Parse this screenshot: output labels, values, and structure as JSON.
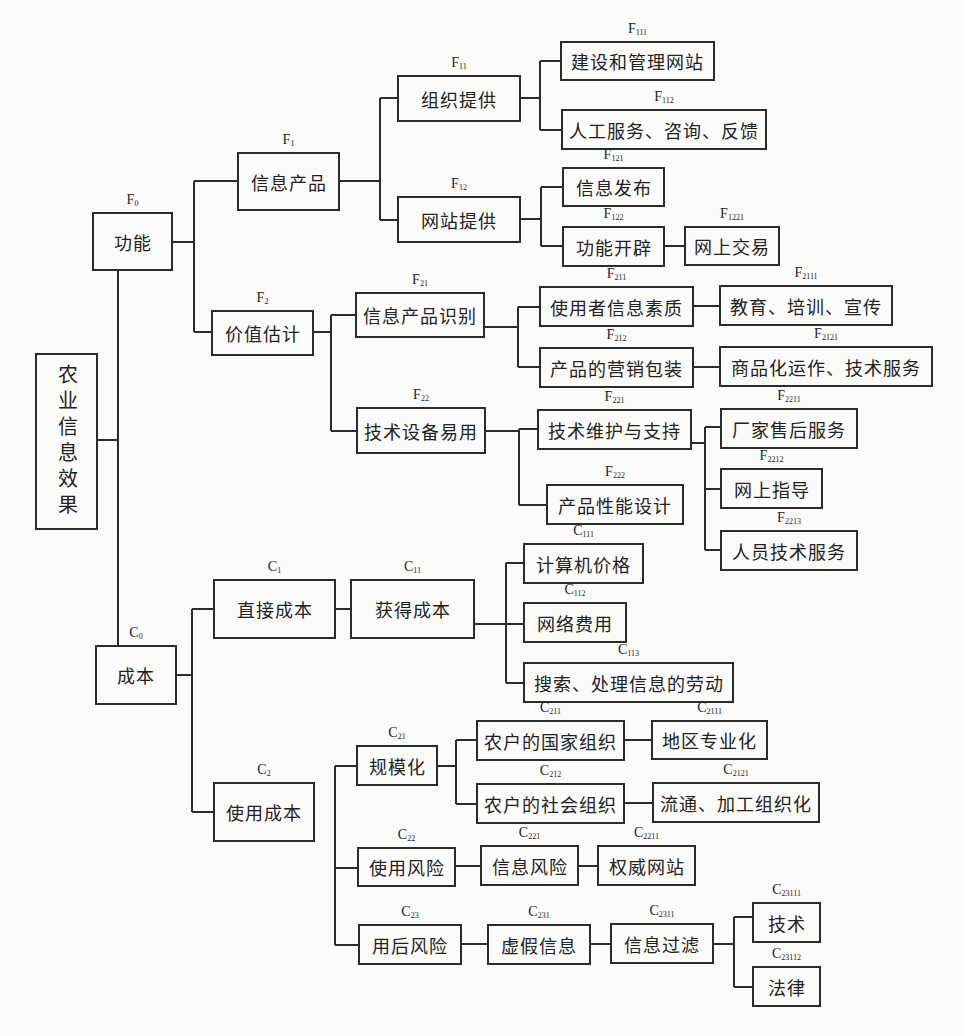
{
  "diagram": {
    "title": "农业信息效果",
    "root": {
      "id": "root",
      "label": "农业信息效果",
      "code": ""
    },
    "nodes": [
      {
        "id": "F0",
        "letter": "F",
        "sub": "0",
        "label": "功能",
        "x": 92,
        "y": 212,
        "w": 81,
        "h": 59
      },
      {
        "id": "F1",
        "letter": "F",
        "sub": "1",
        "label": "信息产品",
        "x": 237,
        "y": 152,
        "w": 103,
        "h": 59
      },
      {
        "id": "F11",
        "letter": "F",
        "sub": "11",
        "label": "组织提供",
        "x": 397,
        "y": 75,
        "w": 124,
        "h": 47
      },
      {
        "id": "F12",
        "letter": "F",
        "sub": "12",
        "label": "网站提供",
        "x": 397,
        "y": 196,
        "w": 124,
        "h": 47
      },
      {
        "id": "F111",
        "letter": "F",
        "sub": "111",
        "label": "建设和管理网站",
        "x": 560,
        "y": 41,
        "w": 155,
        "h": 40
      },
      {
        "id": "F112",
        "letter": "F",
        "sub": "112",
        "label": "人工服务、咨询、反馈",
        "x": 561,
        "y": 109,
        "w": 206,
        "h": 41
      },
      {
        "id": "F121",
        "letter": "F",
        "sub": "121",
        "label": "信息发布",
        "x": 562,
        "y": 167,
        "w": 103,
        "h": 40
      },
      {
        "id": "F122",
        "letter": "F",
        "sub": "122",
        "label": "功能开辟",
        "x": 562,
        "y": 226,
        "w": 103,
        "h": 41
      },
      {
        "id": "F1221",
        "letter": "F",
        "sub": "1221",
        "label": "网上交易",
        "x": 684,
        "y": 226,
        "w": 96,
        "h": 40
      },
      {
        "id": "F2",
        "letter": "F",
        "sub": "2",
        "label": "价值估计",
        "x": 211,
        "y": 310,
        "w": 103,
        "h": 46
      },
      {
        "id": "F21",
        "letter": "F",
        "sub": "21",
        "label": "信息产品识别",
        "x": 355,
        "y": 292,
        "w": 130,
        "h": 46
      },
      {
        "id": "F22",
        "letter": "F",
        "sub": "22",
        "label": "技术设备易用",
        "x": 356,
        "y": 407,
        "w": 130,
        "h": 47
      },
      {
        "id": "F211",
        "letter": "F",
        "sub": "211",
        "label": "使用者信息素质",
        "x": 539,
        "y": 286,
        "w": 155,
        "h": 41
      },
      {
        "id": "F212",
        "letter": "F",
        "sub": "212",
        "label": "产品的营销包装",
        "x": 539,
        "y": 347,
        "w": 155,
        "h": 41
      },
      {
        "id": "F2111",
        "letter": "F",
        "sub": "2111",
        "label": "教育、培训、宣传",
        "x": 719,
        "y": 285,
        "w": 174,
        "h": 41
      },
      {
        "id": "F2121",
        "letter": "F",
        "sub": "2121",
        "label": "商品化运作、技术服务",
        "x": 719,
        "y": 346,
        "w": 214,
        "h": 41
      },
      {
        "id": "F221",
        "letter": "F",
        "sub": "221",
        "label": "技术维护与支持",
        "x": 537,
        "y": 409,
        "w": 155,
        "h": 41
      },
      {
        "id": "F222",
        "letter": "F",
        "sub": "222",
        "label": "产品性能设计",
        "x": 546,
        "y": 484,
        "w": 138,
        "h": 41
      },
      {
        "id": "F2211",
        "letter": "F",
        "sub": "2211",
        "label": "厂家售后服务",
        "x": 720,
        "y": 408,
        "w": 138,
        "h": 41
      },
      {
        "id": "F2212",
        "letter": "F",
        "sub": "2212",
        "label": "网上指导",
        "x": 720,
        "y": 468,
        "w": 103,
        "h": 41
      },
      {
        "id": "F2213",
        "letter": "F",
        "sub": "2213",
        "label": "人员技术服务",
        "x": 720,
        "y": 530,
        "w": 138,
        "h": 41
      },
      {
        "id": "C0",
        "letter": "C",
        "sub": "0",
        "label": "成本",
        "x": 95,
        "y": 645,
        "w": 82,
        "h": 60
      },
      {
        "id": "C1",
        "letter": "C",
        "sub": "1",
        "label": "直接成本",
        "x": 213,
        "y": 579,
        "w": 123,
        "h": 60
      },
      {
        "id": "C11",
        "letter": "C",
        "sub": "11",
        "label": "获得成本",
        "x": 350,
        "y": 579,
        "w": 125,
        "h": 60
      },
      {
        "id": "C111",
        "letter": "C",
        "sub": "111",
        "label": "计算机价格",
        "x": 523,
        "y": 543,
        "w": 121,
        "h": 41
      },
      {
        "id": "C112",
        "letter": "C",
        "sub": "112",
        "label": "网络费用",
        "x": 523,
        "y": 602,
        "w": 104,
        "h": 41
      },
      {
        "id": "C113",
        "letter": "C",
        "sub": "113",
        "label": "搜索、处理信息的劳动",
        "x": 523,
        "y": 662,
        "w": 211,
        "h": 41
      },
      {
        "id": "C2",
        "letter": "C",
        "sub": "2",
        "label": "使用成本",
        "x": 213,
        "y": 782,
        "w": 102,
        "h": 60
      },
      {
        "id": "C21",
        "letter": "C",
        "sub": "21",
        "label": "规模化",
        "x": 356,
        "y": 745,
        "w": 82,
        "h": 41
      },
      {
        "id": "C211",
        "letter": "C",
        "sub": "211",
        "label": "农户的国家组织",
        "x": 476,
        "y": 720,
        "w": 149,
        "h": 41
      },
      {
        "id": "C212",
        "letter": "C",
        "sub": "212",
        "label": "农户的社会组织",
        "x": 476,
        "y": 783,
        "w": 149,
        "h": 41
      },
      {
        "id": "C2111",
        "letter": "C",
        "sub": "2111",
        "label": "地区专业化",
        "x": 651,
        "y": 720,
        "w": 117,
        "h": 40
      },
      {
        "id": "C2121",
        "letter": "C",
        "sub": "2121",
        "label": "流通、加工组织化",
        "x": 652,
        "y": 782,
        "w": 168,
        "h": 41
      },
      {
        "id": "C22",
        "letter": "C",
        "sub": "22",
        "label": "使用风险",
        "x": 357,
        "y": 847,
        "w": 99,
        "h": 40
      },
      {
        "id": "C221",
        "letter": "C",
        "sub": "221",
        "label": "信息风险",
        "x": 480,
        "y": 845,
        "w": 99,
        "h": 41
      },
      {
        "id": "C2211",
        "letter": "C",
        "sub": "2211",
        "label": "权威网站",
        "x": 597,
        "y": 845,
        "w": 99,
        "h": 41
      },
      {
        "id": "C23",
        "letter": "C",
        "sub": "23",
        "label": "用后风险",
        "x": 358,
        "y": 924,
        "w": 104,
        "h": 41
      },
      {
        "id": "C231",
        "letter": "C",
        "sub": "231",
        "label": "虚假信息",
        "x": 487,
        "y": 924,
        "w": 104,
        "h": 41
      },
      {
        "id": "C2311",
        "letter": "C",
        "sub": "2311",
        "label": "信息过滤",
        "x": 610,
        "y": 923,
        "w": 104,
        "h": 41
      },
      {
        "id": "C23111",
        "letter": "C",
        "sub": "23111",
        "label": "技术",
        "x": 752,
        "y": 902,
        "w": 69,
        "h": 41
      },
      {
        "id": "C23112",
        "letter": "C",
        "sub": "23112",
        "label": "法律",
        "x": 752,
        "y": 966,
        "w": 69,
        "h": 41
      }
    ],
    "edges": [
      [
        "root",
        "F0"
      ],
      [
        "root",
        "C0"
      ],
      [
        "F0",
        "F1"
      ],
      [
        "F0",
        "F2"
      ],
      [
        "F1",
        "F11"
      ],
      [
        "F1",
        "F12"
      ],
      [
        "F11",
        "F111"
      ],
      [
        "F11",
        "F112"
      ],
      [
        "F12",
        "F121"
      ],
      [
        "F12",
        "F122"
      ],
      [
        "F122",
        "F1221"
      ],
      [
        "F2",
        "F21"
      ],
      [
        "F2",
        "F22"
      ],
      [
        "F21",
        "F211"
      ],
      [
        "F21",
        "F212"
      ],
      [
        "F211",
        "F2111"
      ],
      [
        "F212",
        "F2121"
      ],
      [
        "F22",
        "F221"
      ],
      [
        "F22",
        "F222"
      ],
      [
        "F221",
        "F2211"
      ],
      [
        "F221",
        "F2212"
      ],
      [
        "F221",
        "F2213"
      ],
      [
        "C0",
        "C1"
      ],
      [
        "C0",
        "C2"
      ],
      [
        "C1",
        "C11"
      ],
      [
        "C11",
        "C111"
      ],
      [
        "C11",
        "C112"
      ],
      [
        "C11",
        "C113"
      ],
      [
        "C21",
        "C211"
      ],
      [
        "C21",
        "C212"
      ],
      [
        "C211",
        "C2111"
      ],
      [
        "C212",
        "C2121"
      ],
      [
        "C22",
        "C221"
      ],
      [
        "C221",
        "C2211"
      ],
      [
        "C23",
        "C231"
      ],
      [
        "C231",
        "C2311"
      ],
      [
        "C2311",
        "C23111"
      ],
      [
        "C2311",
        "C23112"
      ]
    ]
  }
}
